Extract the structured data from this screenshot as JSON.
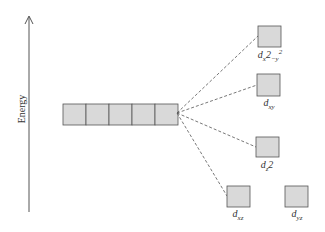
{
  "diagram": {
    "type": "crystal-field-splitting",
    "axis_label": "Energy",
    "colors": {
      "box_fill": "#d9d9d9",
      "box_stroke": "#555555",
      "line": "#555555"
    },
    "degenerate_set": {
      "count": 5
    },
    "orbitals": [
      {
        "id": "dx2-y2",
        "base": "d",
        "sub": "x",
        "sup": "2",
        "sub2": "−y",
        "sup2": "2",
        "label": "dx2−y2"
      },
      {
        "id": "dxy",
        "base": "d",
        "sub": "xy",
        "label": "dxy"
      },
      {
        "id": "dz2",
        "base": "d",
        "sub": "z",
        "tail": "2",
        "label": "dz2"
      },
      {
        "id": "dxz",
        "base": "d",
        "sub": "xz",
        "label": "dxz"
      },
      {
        "id": "dyz",
        "base": "d",
        "sub": "yz",
        "label": "dyz"
      }
    ]
  }
}
